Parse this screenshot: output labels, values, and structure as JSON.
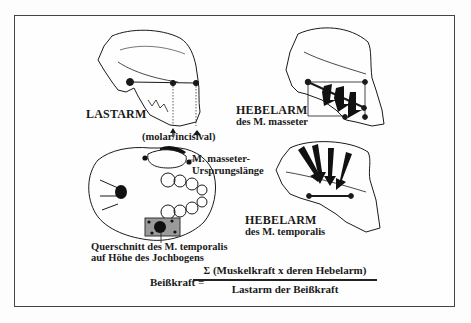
{
  "figure": {
    "panels": [
      {
        "id": "lastarm",
        "label": "LASTARM"
      },
      {
        "id": "hebelarm-masseter",
        "label_line1": "HEBELARM",
        "label_line2": "des M. masseter"
      },
      {
        "id": "hebelarm-temporalis",
        "label_line1": "HEBELARM",
        "label_line2": "des M. temporalis"
      },
      {
        "id": "skull-base",
        "label_line1": "Querschnitt des M. temporalis",
        "label_line2": "auf Höhe des Jochbogens"
      }
    ],
    "annotations": {
      "molar_incisival": "(molar/incisival)",
      "masseter_origin_line1": "M. masseter-",
      "masseter_origin_line2": "Ursprungslänge"
    },
    "formula": {
      "lhs": "Beißkraft =",
      "sigma": "Σ",
      "numerator": "(Muskelkraft x deren Hebelarm)",
      "denominator": "Lastarm der Beißkraft"
    },
    "colors": {
      "ink": "#1a1a1a",
      "paper": "#fefefe",
      "frame": "#444444",
      "shade": "#9a9a9a"
    }
  }
}
